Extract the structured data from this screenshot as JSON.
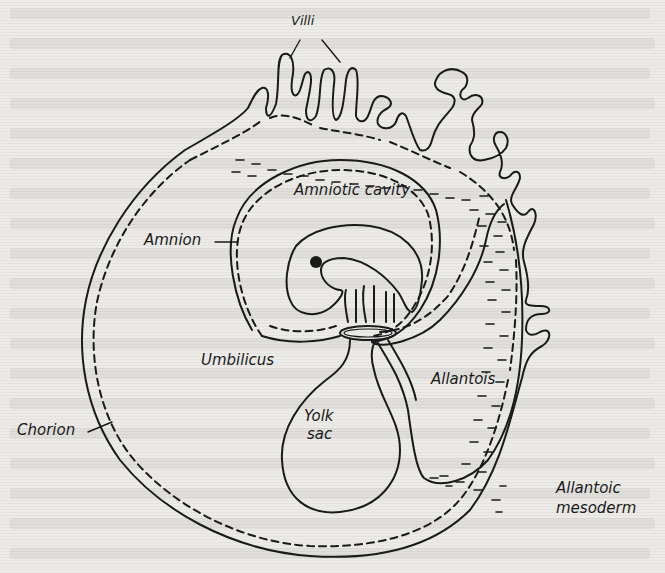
{
  "figure": {
    "colors": {
      "ink": "#1a1a1a",
      "paper": "#ecebe8"
    }
  },
  "labels": {
    "villi": "Villi",
    "amniotic_cavity": "Amniotic cavity",
    "amnion": "Amnion",
    "umbilicus": "Umbilicus",
    "allantois": "Allantois",
    "yolk_sac_line1": "Yolk",
    "yolk_sac_line2": "sac",
    "chorion": "Chorion",
    "allantoic_mesoderm_line1": "Allantoic",
    "allantoic_mesoderm_line2": "mesoderm"
  }
}
